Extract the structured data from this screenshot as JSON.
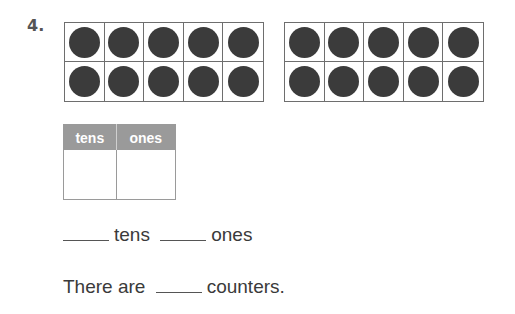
{
  "problem": {
    "number": "4.",
    "ten_frames": [
      {
        "filled": 10,
        "total": 10
      },
      {
        "filled": 10,
        "total": 10
      }
    ],
    "place_value_table": {
      "headers": [
        "tens",
        "ones"
      ],
      "values": [
        "",
        ""
      ]
    },
    "sentence1": {
      "blank1": "",
      "word1": "tens",
      "blank2": "",
      "word2": "ones"
    },
    "sentence2": {
      "prefix": "There are",
      "blank": "",
      "suffix": "counters."
    }
  },
  "colors": {
    "counter": "#3b3b3b",
    "header_bg": "#9a9a9a",
    "frame": "#6e6e6e"
  }
}
